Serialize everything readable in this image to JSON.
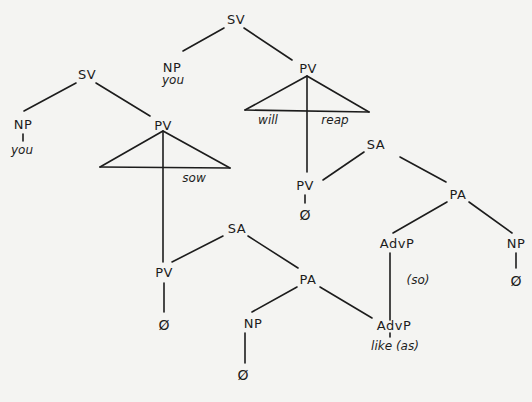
{
  "diagram": {
    "type": "syntax-tree",
    "nodes": {
      "sv_main": "SV",
      "np_main": "NP",
      "np_main_word": "you",
      "pv_main": "PV",
      "pv_main_word_left": "will",
      "pv_main_word_right": "reap",
      "sa_right": "SA",
      "pv_right": "PV",
      "pv_right_null": "Ø",
      "pa_right": "PA",
      "advp_right": "AdvP",
      "advp_right_word": "(so)",
      "np_right": "NP",
      "np_right_null": "Ø",
      "sv_left": "SV",
      "np_left": "NP",
      "np_left_word": "you",
      "pv_left": "PV",
      "pv_left_word": "sow",
      "sa_left": "SA",
      "pv_lower": "PV",
      "pv_lower_null": "Ø",
      "pa_lower": "PA",
      "np_lower": "NP",
      "np_lower_null": "Ø",
      "advp_lower": "AdvP",
      "advp_lower_word": "like (as)"
    }
  }
}
